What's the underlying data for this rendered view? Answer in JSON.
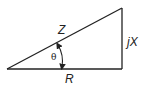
{
  "diagram": {
    "type": "impedance-triangle",
    "labels": {
      "hypotenuse": "Z",
      "horizontal": "R",
      "vertical": "jX",
      "angle": "θ"
    },
    "colors": {
      "stroke": "#222222",
      "background": "#ffffff"
    }
  }
}
